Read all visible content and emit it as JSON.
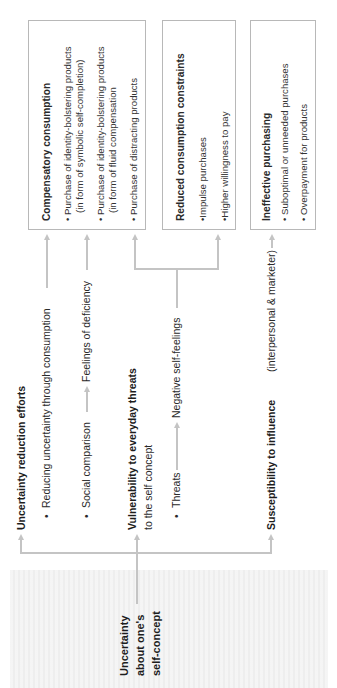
{
  "root": {
    "line1": "Uncertainty",
    "line2": "about one's",
    "line3": "self-concept"
  },
  "branches": [
    {
      "title": "Uncertainty reduction efforts",
      "bullets": [
        {
          "text": "Reducing uncertainty through consumption"
        },
        {
          "from": "Social comparison",
          "to": "Feelings of deficiency"
        }
      ]
    },
    {
      "title": "Vulnerability to everyday threats",
      "subtitle": "to the self concept",
      "bullets": [
        {
          "from": "Threats",
          "to": "Negative self-feelings"
        }
      ]
    },
    {
      "title": "Susceptibility to influence",
      "suffix": "(interpersonal & marketer)"
    }
  ],
  "outcomes": [
    {
      "title": "Compensatory consumption",
      "items": [
        "Purchase of identity-bolstering products",
        "(in form of symbolic self-completion)",
        "Purchase of identity-bolstering products",
        "(in form of fluid compensation",
        "Purchase of distracting products"
      ]
    },
    {
      "title": "Reduced consumption constraints",
      "items": [
        "Impulse purchases",
        "Higher willingness to pay"
      ]
    },
    {
      "title": "Ineffective purchasing",
      "items": [
        "Suboptimal or unneeded purchases",
        "Overpayment for products"
      ]
    }
  ],
  "bullet_glyph": "•",
  "colors": {
    "line": "#c4c4c4",
    "box_border": "#b8b8b8",
    "text": "#2a2a2a"
  }
}
